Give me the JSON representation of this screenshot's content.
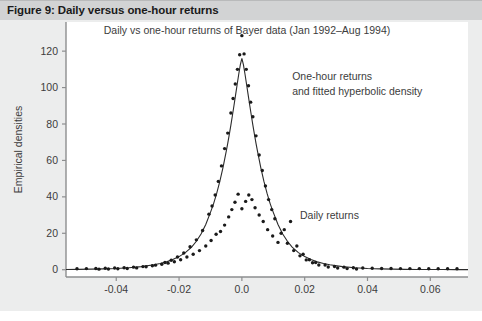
{
  "figure": {
    "caption": "Figure 9: Daily versus one-hour returns",
    "header_bg": "#d2d3d4",
    "body_bg": "#eceded",
    "plot_bg": "#ffffff",
    "ink": "#3c3c3c"
  },
  "chart_data": {
    "type": "scatter",
    "title": "Daily vs one-hour returns of Bayer data (Jan 1992–Aug 1994)",
    "xlabel": "",
    "ylabel": "Empirical densities",
    "xlim": [
      -0.056,
      0.072
    ],
    "ylim": [
      -4,
      136
    ],
    "xticks": [
      -0.04,
      -0.02,
      0.0,
      0.02,
      0.04,
      0.06
    ],
    "xticklabels": [
      "-0.04",
      "-0.02",
      "0.0",
      "0.02",
      "0.04",
      "0.06"
    ],
    "yticks": [
      0,
      20,
      40,
      60,
      80,
      100,
      120
    ],
    "yticklabels": [
      "0",
      "20",
      "40",
      "60",
      "80",
      "100",
      "120"
    ],
    "grid": false,
    "legend": "none",
    "annotations": [
      {
        "text": "One-hour returns",
        "x": 0.016,
        "y": 104
      },
      {
        "text": "and fitted hyperbolic density",
        "x": 0.016,
        "y": 96
      },
      {
        "text": "Daily returns",
        "x": 0.0185,
        "y": 28
      }
    ],
    "series": [
      {
        "name": "fitted hyperbolic density",
        "type": "line",
        "color": "#2b2b2b",
        "x": [
          -0.056,
          -0.052,
          -0.048,
          -0.044,
          -0.04,
          -0.036,
          -0.032,
          -0.028,
          -0.026,
          -0.024,
          -0.022,
          -0.02,
          -0.018,
          -0.016,
          -0.0145,
          -0.013,
          -0.0115,
          -0.01,
          -0.009,
          -0.008,
          -0.007,
          -0.006,
          -0.005,
          -0.0045,
          -0.004,
          -0.0035,
          -0.003,
          -0.0025,
          -0.002,
          -0.0015,
          -0.001,
          -0.0005,
          0.0,
          0.0005,
          0.001,
          0.0015,
          0.002,
          0.0025,
          0.003,
          0.0035,
          0.004,
          0.0045,
          0.005,
          0.006,
          0.007,
          0.008,
          0.009,
          0.01,
          0.0115,
          0.013,
          0.0145,
          0.016,
          0.018,
          0.02,
          0.022,
          0.024,
          0.026,
          0.028,
          0.032,
          0.036,
          0.04,
          0.044,
          0.048,
          0.052,
          0.056,
          0.06,
          0.064,
          0.068,
          0.072
        ],
        "y": [
          0.15,
          0.2,
          0.3,
          0.45,
          0.7,
          1.1,
          1.7,
          2.7,
          3.4,
          4.3,
          5.6,
          7.2,
          9.4,
          12.4,
          15.6,
          19.6,
          24.8,
          31.5,
          36.3,
          42.0,
          48.6,
          56.2,
          64.8,
          69.4,
          74.3,
          79.4,
          84.8,
          90.3,
          96.0,
          101.7,
          107.3,
          112.5,
          116.0,
          112.5,
          107.3,
          101.7,
          96.0,
          90.3,
          84.8,
          79.4,
          74.3,
          69.4,
          64.8,
          56.2,
          48.6,
          42.0,
          36.3,
          31.5,
          24.8,
          19.6,
          15.6,
          12.4,
          9.4,
          7.2,
          5.6,
          4.3,
          3.4,
          2.7,
          1.7,
          1.1,
          0.7,
          0.45,
          0.3,
          0.2,
          0.15,
          0.1,
          0.08,
          0.06,
          0.05
        ]
      },
      {
        "name": "One-hour returns",
        "type": "points",
        "color": "#1a1a1a",
        "x": [
          -0.0455,
          -0.0425,
          -0.0395,
          -0.0365,
          -0.0335,
          -0.0305,
          -0.0275,
          -0.0245,
          -0.0225,
          -0.0205,
          -0.0185,
          -0.0165,
          -0.0145,
          -0.0125,
          -0.0105,
          -0.0095,
          -0.0085,
          -0.0075,
          -0.0065,
          -0.0055,
          -0.0045,
          -0.0035,
          -0.0028,
          -0.0021,
          -0.0014,
          -0.0007,
          0.0,
          0.0007,
          0.0014,
          0.0021,
          0.0028,
          0.0035,
          0.0045,
          0.0055,
          0.0065,
          0.0075,
          0.0085,
          0.0095,
          0.0105,
          0.0125,
          0.0145,
          0.0165,
          0.0185,
          0.0205,
          0.0225,
          0.0245,
          0.0275,
          0.0305,
          0.0335,
          0.0365
        ],
        "y": [
          0.3,
          0.4,
          0.5,
          0.7,
          1.0,
          1.6,
          2.5,
          4.0,
          5.2,
          7.0,
          9.2,
          12.6,
          16.4,
          21.5,
          30.5,
          35.0,
          41.0,
          48.5,
          57.0,
          66.5,
          75.0,
          86.0,
          94.0,
          102.0,
          110.0,
          118.0,
          128.5,
          118.5,
          110.0,
          101.0,
          92.0,
          84.0,
          73.5,
          63.0,
          54.5,
          46.0,
          38.5,
          33.0,
          28.0,
          20.0,
          14.5,
          10.5,
          7.6,
          5.4,
          3.8,
          2.6,
          1.5,
          0.9,
          0.6,
          0.4
        ]
      },
      {
        "name": "Daily returns",
        "type": "points",
        "color": "#1a1a1a",
        "x": [
          -0.0525,
          -0.0495,
          -0.0465,
          -0.0435,
          -0.0405,
          -0.0375,
          -0.0345,
          -0.0315,
          -0.0285,
          -0.0255,
          -0.0235,
          -0.0215,
          -0.0195,
          -0.0175,
          -0.0155,
          -0.0135,
          -0.0115,
          -0.0098,
          -0.0082,
          -0.0068,
          -0.0055,
          -0.0042,
          -0.0032,
          -0.0022,
          -0.0012,
          0.0,
          0.0012,
          0.0022,
          0.0032,
          0.0042,
          0.0055,
          0.0068,
          0.0082,
          0.0098,
          0.0115,
          0.0135,
          0.0155,
          0.0175,
          0.0195,
          0.0215,
          0.0235,
          0.0265,
          0.0295,
          0.0325,
          0.0355,
          0.0385,
          0.0415,
          0.0445,
          0.0475,
          0.0505,
          0.0535,
          0.0565,
          0.0595,
          0.0625,
          0.0655,
          0.0685
        ],
        "y": [
          0.5,
          0.6,
          0.7,
          0.8,
          0.9,
          1.1,
          1.4,
          1.7,
          2.2,
          3.0,
          3.6,
          4.4,
          5.5,
          7.0,
          8.5,
          10.5,
          13.0,
          16.0,
          19.5,
          21.0,
          24.5,
          29.0,
          33.0,
          37.0,
          41.5,
          33.5,
          37.5,
          41.0,
          38.5,
          34.0,
          30.0,
          26.5,
          22.0,
          18.5,
          15.0,
          22.0,
          26.5,
          13.0,
          8.5,
          5.5,
          4.0,
          2.6,
          1.8,
          1.4,
          1.1,
          0.9,
          0.8,
          0.7,
          0.7,
          0.6,
          0.6,
          0.6,
          0.5,
          0.5,
          0.5,
          0.5
        ]
      }
    ]
  }
}
